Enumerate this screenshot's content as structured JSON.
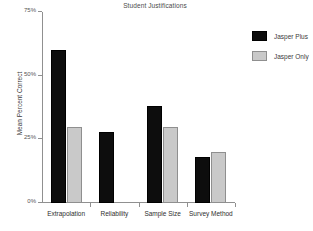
{
  "chart_data": {
    "type": "bar",
    "title": "Student Justifications",
    "xlabel": "",
    "ylabel": "Mean Percent Correct",
    "ylim": [
      0,
      75
    ],
    "yticks": [
      "0%",
      "25%",
      "50%",
      "75%"
    ],
    "ytick_values": [
      0,
      25,
      50,
      75
    ],
    "grid": false,
    "legend_position": "right",
    "categories": [
      "Extrapolation",
      "Reliability",
      "Sample Size",
      "Survey Method"
    ],
    "series": [
      {
        "name": "Jasper Plus",
        "color": "#0d0d0d",
        "values": [
          60,
          28,
          38,
          18
        ]
      },
      {
        "name": "Jasper Only",
        "color": "#c9c9c9",
        "values": [
          30,
          0,
          30,
          20
        ]
      }
    ]
  }
}
